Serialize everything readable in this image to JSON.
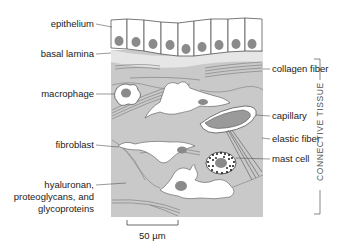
{
  "diagram": {
    "labels_left": {
      "epithelium": "epithelium",
      "basal_lamina": "basal lamina",
      "macrophage": "macrophage",
      "fibroblast": "fibroblast",
      "matrix_line1": "hyaluronan,",
      "matrix_line2": "proteoglycans, and",
      "matrix_line3": "glycoproteins"
    },
    "labels_right": {
      "collagen_fiber": "collagen fiber",
      "capillary": "capillary",
      "elastic_fiber": "elastic fiber",
      "mast_cell": "mast cell"
    },
    "bracket_label": "CONNECTIVE TISSUE",
    "scale_bar": "50 µm",
    "colors": {
      "matrix": "#c9c9c9",
      "basal_lamina": "#e4e4e4",
      "nucleus": "#8a8a8a",
      "outline": "#555555",
      "cell_fill": "#ffffff",
      "fiber": "#7a7a7a"
    }
  }
}
